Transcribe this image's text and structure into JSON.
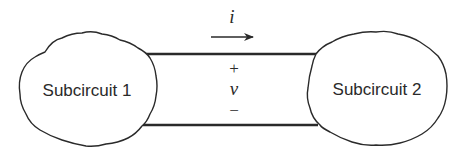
{
  "diagram": {
    "type": "two-subcircuit interconnection",
    "subcircuits": [
      {
        "id": "subcircuit-1",
        "label": "Subcircuit 1"
      },
      {
        "id": "subcircuit-2",
        "label": "Subcircuit 2"
      }
    ],
    "current": {
      "symbol": "i",
      "direction": "left-to-right"
    },
    "voltage": {
      "symbol": "v",
      "positive": "+",
      "negative": "−"
    },
    "colors": {
      "stroke": "#2a2a2a",
      "background": "#ffffff"
    }
  }
}
